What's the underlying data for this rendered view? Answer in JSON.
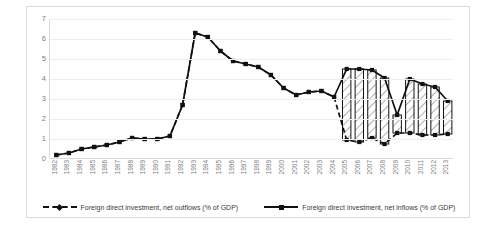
{
  "chart_data": {
    "type": "line",
    "title": "",
    "xlabel": "",
    "ylabel": "",
    "ylim": [
      0,
      7
    ],
    "yticks": [
      0,
      1,
      2,
      3,
      4,
      5,
      6,
      7
    ],
    "grid": true,
    "legend_position": "bottom",
    "categories": [
      "1982",
      "1983",
      "1984",
      "1985",
      "1986",
      "1987",
      "1988",
      "1989",
      "1990",
      "1991",
      "1992",
      "1993",
      "1994",
      "1995",
      "1996",
      "1997",
      "1998",
      "1999",
      "2000",
      "2001",
      "2002",
      "2003",
      "2004",
      "2005",
      "2006",
      "2007",
      "2008",
      "2009",
      "2010",
      "2011",
      "2012",
      "2013"
    ],
    "series": [
      {
        "name": "Foreign direct investment, net inflows (% of GDP)",
        "style": "solid",
        "color": "#111111",
        "values": [
          0.2,
          0.3,
          0.5,
          0.6,
          0.7,
          0.85,
          1.05,
          1.0,
          1.0,
          1.15,
          2.7,
          6.3,
          6.1,
          5.4,
          4.9,
          4.75,
          4.6,
          4.2,
          3.55,
          3.2,
          3.35,
          3.4,
          3.1,
          4.5,
          4.5,
          4.45,
          4.05,
          2.2,
          4.0,
          3.75,
          3.6,
          2.9
        ]
      },
      {
        "name": "Foreign direct investment, net outflows (% of GDP)",
        "style": "dashed",
        "color": "#111111",
        "values": [
          0.2,
          0.3,
          0.5,
          0.6,
          0.7,
          0.85,
          1.05,
          1.0,
          1.0,
          1.15,
          2.7,
          6.3,
          6.1,
          5.4,
          4.9,
          4.75,
          4.6,
          4.2,
          3.55,
          3.2,
          3.35,
          3.4,
          3.1,
          0.95,
          0.85,
          1.05,
          0.75,
          1.3,
          1.3,
          1.2,
          1.2,
          1.25
        ]
      }
    ],
    "band_fill": {
      "pattern": "diagonal-hatch",
      "start_category": "2005",
      "end_category": "2013",
      "note": "Vertical hatched bands drawn between the two series from 2005 onward"
    }
  },
  "legend": {
    "entries": [
      {
        "label": "Foreign direct investment, net outflows (% of GDP)",
        "marker": "dashed-line-diamond-marker"
      },
      {
        "label": "Foreign direct investment, net inflows (% of GDP)",
        "marker": "solid-line-square-marker"
      }
    ]
  }
}
